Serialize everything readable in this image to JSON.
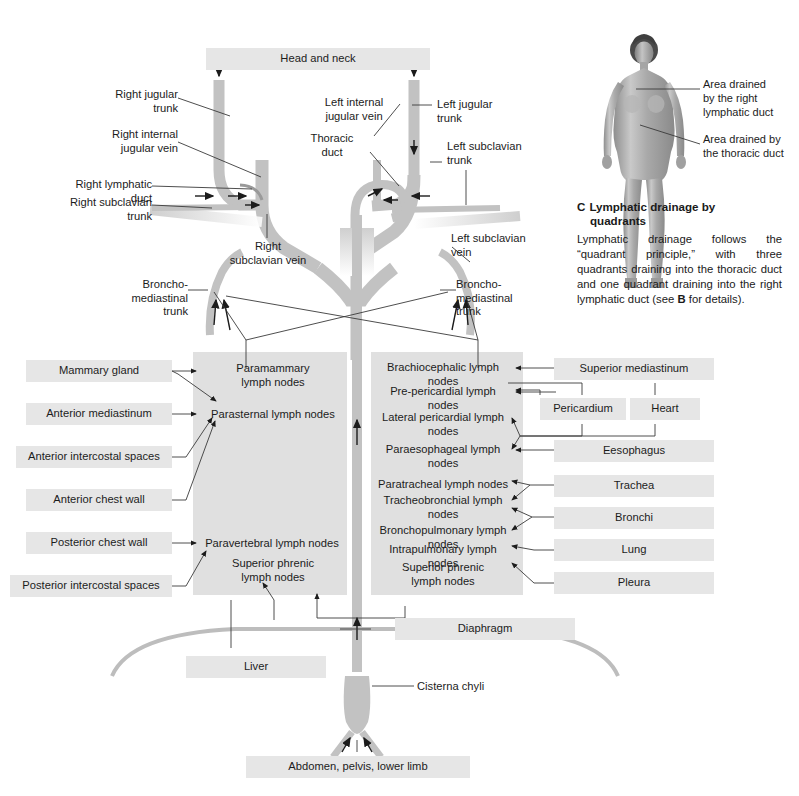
{
  "figure": {
    "top_source_box": "Head and neck",
    "bottom_source_box": "Abdomen, pelvis, lower limb"
  },
  "vessel_labels": {
    "right_jugular_trunk": "Right jugular\ntrunk",
    "right_internal_jugular_vein": "Right internal\njugular vein",
    "right_lymphatic_duct": "Right lymphatic\nduct",
    "right_subclavian_trunk": "Right subclavian\ntrunk",
    "right_subclavian_vein": "Right\nsubclavian vein",
    "left_internal_jugular_vein": "Left internal\njugular vein",
    "thoracic_duct": "Thoracic\nduct",
    "left_jugular_trunk": "Left jugular\ntrunk",
    "left_subclavian_trunk": "Left subclavian\ntrunk",
    "left_subclavian_vein": "Left subclavian\nvein",
    "broncho_mediastinal_trunk_left": "Broncho-\nmediastinal\ntrunk",
    "broncho_mediastinal_trunk_right": "Broncho-\nmediastinal\ntrunk",
    "cisterna_chyli": "Cisterna chyli"
  },
  "left_sources": [
    "Mammary gland",
    "Anterior mediastinum",
    "Anterior intercostal spaces",
    "Anterior chest wall",
    "Posterior chest wall",
    "Posterior intercostal spaces"
  ],
  "left_nodes": [
    "Paramammary\nlymph nodes",
    "Parasternal lymph nodes",
    "Paravertebral lymph nodes",
    "Superior phrenic\nlymph nodes"
  ],
  "right_nodes": [
    "Brachiocephalic lymph nodes",
    "Pre-pericardial lymph nodes",
    "Lateral pericardial lymph\nnodes",
    "Paraesophageal lymph\nnodes",
    "Paratracheal lymph nodes",
    "Tracheobronchial lymph\nnodes",
    "Bronchopulmonary lymph\nnodes",
    "Intrapulmonary lymph nodes",
    "Superior phrenic\nlymph nodes"
  ],
  "right_sources": [
    "Superior mediastinum",
    "Pericardium",
    "Heart",
    "Eesophagus",
    "Trachea",
    "Bronchi",
    "Lung",
    "Pleura"
  ],
  "organ_labels": {
    "diaphragm": "Diaphragm",
    "liver": "Liver"
  },
  "section_c": {
    "letter": "C",
    "title_line1": "Lymphatic drainage by",
    "title_line2": "quadrants",
    "body_part1": "Lymphatic drainage follows the “quadrant principle,” with three quadrants draining into the thoracic duct and one quadrant draining into the right lymphatic duct (see ",
    "body_bold": "B",
    "body_part2": " for details).",
    "callout_right_duct": "Area drained\nby the right\nlymphatic duct",
    "callout_thoracic_duct": "Area drained by\nthe thoracic duct"
  },
  "colors": {
    "box_grey": "#e6e6e6",
    "panel_grey": "#e0e0e0",
    "vessel_grey": "#c2c2c2",
    "line": "#3a3a3a",
    "text": "#1c1c1c"
  }
}
